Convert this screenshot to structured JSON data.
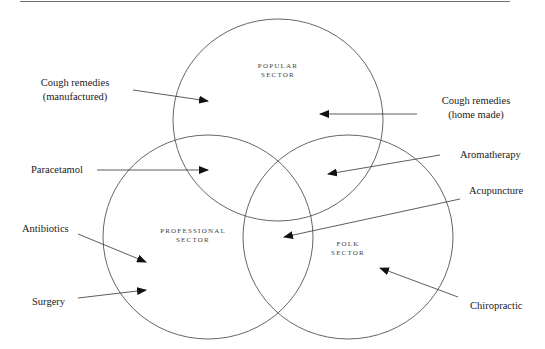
{
  "diagram": {
    "sectors": [
      {
        "id": "popular",
        "line1": "POPULAR",
        "line2": "SECTOR"
      },
      {
        "id": "professional",
        "line1": "PROFESSIONAL",
        "line2": "SECTOR"
      },
      {
        "id": "folk",
        "line1": "FOLK",
        "line2": "SECTOR"
      }
    ],
    "labels": [
      {
        "id": "cough-manufactured",
        "line1": "Cough remedies",
        "line2": "(manufactured)",
        "points_to": "popular"
      },
      {
        "id": "cough-home-made",
        "line1": "Cough remedies",
        "line2": "(home made)",
        "points_to": "popular"
      },
      {
        "id": "paracetamol",
        "text": "Paracetamol",
        "points_to": "popular ∩ professional"
      },
      {
        "id": "aromatherapy",
        "text": "Aromatherapy",
        "points_to": "popular ∩ folk"
      },
      {
        "id": "acupuncture",
        "text": "Acupuncture",
        "points_to": "professional ∩ folk"
      },
      {
        "id": "antibiotics",
        "text": "Antibiotics",
        "points_to": "professional"
      },
      {
        "id": "surgery",
        "text": "Surgery",
        "points_to": "professional"
      },
      {
        "id": "chiropractic",
        "text": "Chiropractic",
        "points_to": "folk"
      }
    ],
    "colors": {
      "stroke": "#555555",
      "text": "#222222",
      "arrow": "#111111"
    }
  }
}
